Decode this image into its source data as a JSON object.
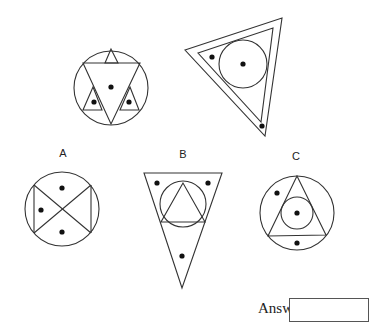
{
  "question": {
    "type": "odd-one-out / analogy puzzle",
    "example_figures": [
      {
        "id": "example-1",
        "description": "Circle containing a star formed by an inverted triangle and three small corner triangles; dots in center and two lower small triangles"
      },
      {
        "id": "example-2",
        "description": "Tilted double-outlined triangle with inscribed circle; dots in circle center and two corners"
      }
    ],
    "options": [
      {
        "label": "A",
        "description": "Circle with bow-tie chords forming an X; three dots"
      },
      {
        "label": "B",
        "description": "Inverted triangle containing circle with inscribed triangle; three dots"
      },
      {
        "label": "C",
        "description": "Circle containing triangle with inscribed small circle; three dots"
      }
    ]
  },
  "answer": {
    "label": "Answer:",
    "value": ""
  }
}
